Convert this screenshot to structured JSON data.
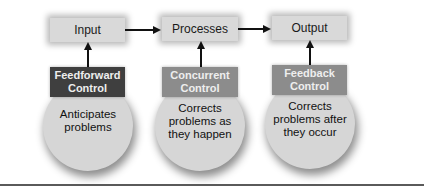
{
  "diagram": {
    "type": "control process flow",
    "stages": [
      {
        "label": "Input"
      },
      {
        "label": "Processes"
      },
      {
        "label": "Output"
      }
    ],
    "controls": [
      {
        "title_line1": "Feedforward",
        "title_line2": "Control",
        "desc_line1": "Anticipates",
        "desc_line2": "problems",
        "desc_line3": "",
        "color": "#3f3f3f"
      },
      {
        "title_line1": "Concurrent",
        "title_line2": "Control",
        "desc_line1": "Corrects",
        "desc_line2": "problems as",
        "desc_line3": "they happen",
        "color": "#8c8c8c"
      },
      {
        "title_line1": "Feedback",
        "title_line2": "Control",
        "desc_line1": "Corrects",
        "desc_line2": "problems after",
        "desc_line3": "they occur",
        "color": "#8c8c8c"
      }
    ],
    "colors": {
      "stage_box": "#d9d9d9",
      "circle": "#d6d6d6",
      "arrow": "#111111",
      "baseline": "#5a5a5a"
    }
  }
}
